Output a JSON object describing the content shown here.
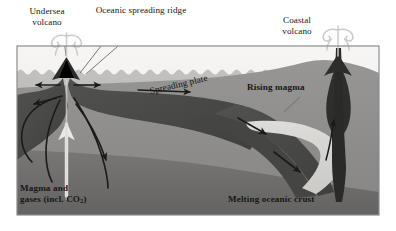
{
  "figure": {
    "type": "geological cross-section diagram",
    "border_color": "#8c8c8c",
    "background_color": "#ffffff"
  },
  "labels": {
    "undersea_volcano": "Undersea volcano",
    "oceanic_spreading_ridge": "Oceanic spreading ridge",
    "coastal_volcano": "Coastal volcano",
    "spreading_plate": "Spreading plate",
    "rising_magma": "Rising magma",
    "magma_and_gases_line1": "Magma and",
    "magma_and_gases_line2_pre": "gases (incl. CO",
    "magma_and_gases_sub": "2",
    "magma_and_gases_line2_post": ")",
    "melting_oceanic_crust": "Melting oceanic crust"
  },
  "colors": {
    "sky": "#f0efed",
    "water": "#b9b8b6",
    "upper_mantle": "#8e8d8b",
    "lower_mantle": "#6f6e6c",
    "slab_dark": "#4a4a49",
    "deep_mantle": "#b5b4b2",
    "melt_wedge": "#d5d4d1",
    "magma_chamber": "#3a3a39",
    "plume_gray": "#cfcecc",
    "ink": "#161616",
    "arrow": "#1a1a1a",
    "leader": "#5e5e5e"
  },
  "icons": {
    "undersea_plume": "volcano-plume-icon",
    "coastal_plume": "volcano-plume-icon",
    "magma_riser": "upward-arrow-icon"
  },
  "flow_arrows": {
    "count": 11,
    "description": "mantle convection and plate-motion direction arrows"
  }
}
